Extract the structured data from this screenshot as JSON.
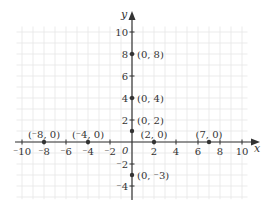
{
  "diagram": {
    "type": "coordinate-plane",
    "axes": {
      "x_label": "x",
      "y_label": "y",
      "origin_label": "0",
      "x_range": [
        -10,
        10
      ],
      "y_range": [
        -5,
        10
      ],
      "x_ticks": [
        {
          "value": -10,
          "label": "⁻10"
        },
        {
          "value": -8,
          "label": "⁻8"
        },
        {
          "value": -6,
          "label": "⁻6"
        },
        {
          "value": -4,
          "label": "⁻4"
        },
        {
          "value": -2,
          "label": "⁻2"
        },
        {
          "value": 2,
          "label": "2"
        },
        {
          "value": 4,
          "label": "4"
        },
        {
          "value": 6,
          "label": "6"
        },
        {
          "value": 8,
          "label": "8"
        },
        {
          "value": 10,
          "label": "10"
        }
      ],
      "y_ticks": [
        {
          "value": 10,
          "label": "10"
        },
        {
          "value": 8,
          "label": "8"
        },
        {
          "value": 6,
          "label": "6"
        },
        {
          "value": 4,
          "label": "4"
        },
        {
          "value": 2,
          "label": "2"
        },
        {
          "value": -2,
          "label": "⁻2"
        },
        {
          "value": -4,
          "label": "⁻4"
        }
      ]
    },
    "points": [
      {
        "label": "(0, 8)",
        "x": 0,
        "y": 8
      },
      {
        "label": "(0, 4)",
        "x": 0,
        "y": 4
      },
      {
        "label": "(0, 2)",
        "x": 0,
        "y": 1
      },
      {
        "label": "(⁻8, 0)",
        "x": -8,
        "y": 0
      },
      {
        "label": "(⁻4, 0)",
        "x": -4,
        "y": 0
      },
      {
        "label": "(2, 0)",
        "x": 2,
        "y": 0
      },
      {
        "label": "(7, 0)",
        "x": 7,
        "y": 0
      },
      {
        "label": "(0, ⁻3)",
        "x": 0,
        "y": -3
      }
    ],
    "colors": {
      "grid": "#e6e6e6",
      "axis": "#333333",
      "point": "#333333",
      "text": "#333333"
    }
  }
}
